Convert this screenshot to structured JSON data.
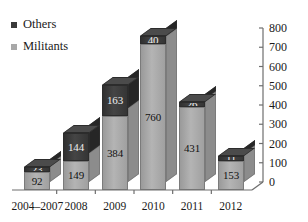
{
  "legend": {
    "position": "top-left",
    "items": [
      {
        "label": "Others",
        "color": "#3a3a3a",
        "swatch_name": "legend-swatch-others"
      },
      {
        "label": "Militants",
        "color": "#a8a8a8",
        "swatch_name": "legend-swatch-militants"
      }
    ]
  },
  "chart_data": {
    "type": "bar",
    "subtype": "stacked-column-3d",
    "title": "",
    "subtitle": "",
    "xlabel": "",
    "ylabel": "",
    "ylim": [
      0,
      800
    ],
    "yticks": [
      0,
      100,
      200,
      300,
      400,
      500,
      600,
      700,
      800
    ],
    "ytick_labels": [
      "0",
      "100",
      "200",
      "300",
      "400",
      "500",
      "600",
      "700",
      "800"
    ],
    "y_axis_position": "right",
    "grid": false,
    "legend_position": "top-left",
    "categories": [
      "2004–2007",
      "2008",
      "2009",
      "2010",
      "2011",
      "2012"
    ],
    "series": [
      {
        "name": "Militants",
        "color": "#a8a8a8",
        "values": [
          92,
          149,
          384,
          760,
          431,
          153
        ],
        "data_labels": [
          "92",
          "149",
          "384",
          "760",
          "431",
          "153"
        ]
      },
      {
        "name": "Others",
        "color": "#3a3a3a",
        "values": [
          23,
          144,
          163,
          40,
          26,
          11
        ],
        "data_labels": [
          "23",
          "144",
          "163",
          "40",
          "26",
          "11"
        ]
      }
    ],
    "totals": [
      115,
      293,
      547,
      800,
      457,
      164
    ]
  },
  "axis": {
    "tick_labels": [
      "800",
      "700",
      "600",
      "500",
      "400",
      "300",
      "200",
      "100",
      "0"
    ],
    "category_labels": [
      "2004–2007",
      "2008",
      "2009",
      "2010",
      "2011",
      "2012"
    ]
  },
  "colors": {
    "militants": "#a8a8a8",
    "others": "#3a3a3a",
    "axis": "#6e6e6e",
    "text": "#1a1a1a",
    "background": "#ffffff"
  }
}
